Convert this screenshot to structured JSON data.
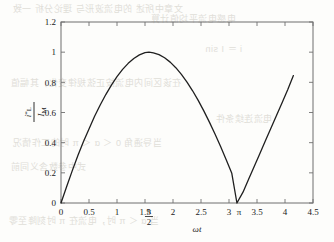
{
  "figure": {
    "background_color": "#fdfdfb",
    "axis_color": "#6f6f6f",
    "curve_color": "#1f1f1f"
  },
  "bleed_through_text": {
    "line1": "文章中所述 的电流波形与 理论分析 一致",
    "line2": "电感电流平均值计算",
    "line3": "i ＝ I sin",
    "line4": "在该区间内电流按正弦规律变化，其幅值",
    "line5": "电流连续条件",
    "line6": "当导通角 0 ＜ α ＜ π 时的工作情况",
    "line7": "式中参数含义同前",
    "line8": "当 α ＜ π 时，电流在 π 时刻降至零"
  },
  "chart_data": {
    "type": "line",
    "title": "",
    "subtitle": "",
    "xlabel": "ωt",
    "ylabel_numerator": "i*L",
    "ylabel_denominator": "IM",
    "ylabel": "i*L / IM",
    "grid": false,
    "legend": null,
    "xlim": [
      0,
      4.5
    ],
    "ylim": [
      0,
      1.2
    ],
    "xticks": [
      0,
      0.5,
      1,
      1.5,
      2,
      2.5,
      3,
      3.5,
      4,
      4.5
    ],
    "xtick_labels": [
      "0",
      "0.5",
      "1",
      "1.5",
      "2",
      "2.5",
      "3",
      "3.5",
      "4",
      "4.5"
    ],
    "yticks": [
      0,
      0.2,
      0.4,
      0.6,
      0.8,
      1,
      1.2
    ],
    "ytick_labels": [
      "0",
      "0.2",
      "0.4",
      "0.6",
      "0.8",
      "1",
      "1.2"
    ],
    "annotations": [
      {
        "name": "pi-over-2-marker",
        "numerator": "π",
        "denominator": "2",
        "x": 1.5708,
        "axis": "x"
      },
      {
        "name": "pi-marker",
        "text": "π",
        "x": 3.1416,
        "axis": "x"
      }
    ],
    "series": [
      {
        "name": "normalized-inductor-current",
        "color": "#1f1f1f",
        "line_width": 1.3,
        "x": [
          0,
          0.1,
          0.2,
          0.3,
          0.4,
          0.5,
          0.6,
          0.7,
          0.8,
          0.9,
          1.0,
          1.1,
          1.2,
          1.3,
          1.4,
          1.5,
          1.5708,
          1.65,
          1.75,
          1.85,
          1.95,
          2.05,
          2.15,
          2.25,
          2.35,
          2.45,
          2.55,
          2.65,
          2.75,
          2.85,
          2.95,
          3.05,
          3.1416,
          3.25,
          3.35,
          3.45,
          3.55,
          3.65,
          3.75,
          3.85,
          3.95,
          4.05,
          4.15
        ],
        "y": [
          0,
          0.108,
          0.213,
          0.313,
          0.406,
          0.491,
          0.575,
          0.65,
          0.719,
          0.782,
          0.838,
          0.886,
          0.926,
          0.958,
          0.982,
          0.997,
          1.0,
          0.996,
          0.984,
          0.963,
          0.934,
          0.897,
          0.853,
          0.802,
          0.744,
          0.68,
          0.611,
          0.536,
          0.457,
          0.374,
          0.287,
          0.197,
          0.0,
          0.072,
          0.157,
          0.242,
          0.327,
          0.412,
          0.497,
          0.582,
          0.667,
          0.752,
          0.845
        ]
      }
    ]
  }
}
